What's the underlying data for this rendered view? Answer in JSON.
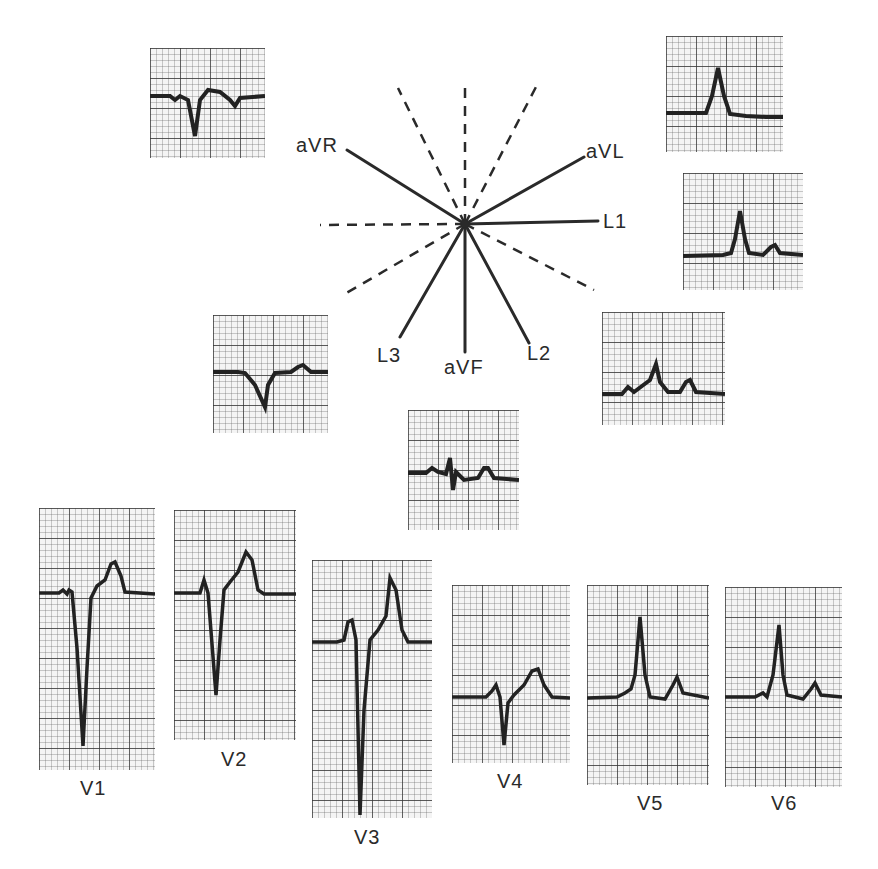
{
  "figure": {
    "type": "hexaxial reference system with ECG lead tracings",
    "axis_labels": {
      "aVR": "aVR",
      "aVL": "aVL",
      "L1": "L1",
      "L2": "L2",
      "L3": "L3",
      "aVF": "aVF"
    },
    "limb_leads": [
      {
        "lead": "aVR",
        "morphology": "negative QRS, inverted T"
      },
      {
        "lead": "aVL",
        "morphology": "upright R wave"
      },
      {
        "lead": "L1",
        "morphology": "upright R, upright T"
      },
      {
        "lead": "L2",
        "morphology": "P, upright R, upright T"
      },
      {
        "lead": "L3",
        "morphology": "negative QRS, small upright T"
      },
      {
        "lead": "aVF",
        "morphology": "small biphasic QRS, upright T"
      }
    ],
    "precordial_leads": [
      {
        "lead": "V1",
        "label": "V1",
        "morphology": "deep QS, upright T"
      },
      {
        "lead": "V2",
        "label": "V2",
        "morphology": "small r, deep S, upright T"
      },
      {
        "lead": "V3",
        "label": "V3",
        "morphology": "r, very deep S, tall T"
      },
      {
        "lead": "V4",
        "label": "V4",
        "morphology": "small r, S, upright T"
      },
      {
        "lead": "V5",
        "label": "V5",
        "morphology": "tall R, upright T"
      },
      {
        "lead": "V6",
        "label": "V6",
        "morphology": "tall R, upright T"
      }
    ],
    "colors": {
      "ink": "#2a2a2a",
      "grid": "#3a3a3a",
      "paper": "#f4f4f4"
    }
  }
}
